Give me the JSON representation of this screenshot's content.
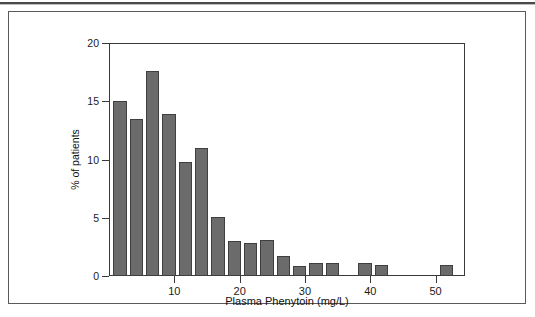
{
  "figure": {
    "has_top_rule": true,
    "border_color": "#5a5a5a",
    "background": "#ffffff"
  },
  "chart_data": {
    "type": "bar",
    "title": "",
    "subtitle": "",
    "xlabel": "Plasma Phenytoin (mg/L)",
    "ylabel": "% of patients",
    "xlim": [
      0,
      54.5
    ],
    "ylim": [
      0,
      20
    ],
    "xticks": [
      10,
      20,
      30,
      40,
      50
    ],
    "xticklabels": [
      "10",
      "20",
      "30",
      "40",
      "50"
    ],
    "yticks": [
      0,
      5,
      10,
      15,
      20
    ],
    "yticklabels": [
      "0",
      "5",
      "10",
      "15",
      "20"
    ],
    "grid": false,
    "legend": null,
    "bar_color": "#6b6b6b",
    "bar_edge_color": "#3f3f3f",
    "bin_width": 2.5,
    "bin_starts": [
      0.5,
      3.0,
      5.5,
      8.0,
      10.5,
      13.0,
      15.5,
      18.0,
      20.5,
      23.0,
      25.5,
      28.0,
      30.5,
      33.0,
      35.5,
      38.0,
      40.5,
      43.0,
      45.5,
      48.0,
      50.5
    ],
    "categories": [
      "0.5-3",
      "3-5.5",
      "5.5-8",
      "8-10.5",
      "10.5-13",
      "13-15.5",
      "15.5-18",
      "18-20.5",
      "20.5-23",
      "23-25.5",
      "25.5-28",
      "28-30.5",
      "30.5-33",
      "33-35.5",
      "35.5-38",
      "38-40.5",
      "40.5-43",
      "43-45.5",
      "45.5-48",
      "48-50.5",
      "50.5-53"
    ],
    "values": [
      15.0,
      13.5,
      17.6,
      13.9,
      9.8,
      11.0,
      5.1,
      3.0,
      2.8,
      3.05,
      1.75,
      0.9,
      1.1,
      1.15,
      0,
      1.15,
      0.95,
      0,
      0,
      0,
      0.95
    ]
  }
}
